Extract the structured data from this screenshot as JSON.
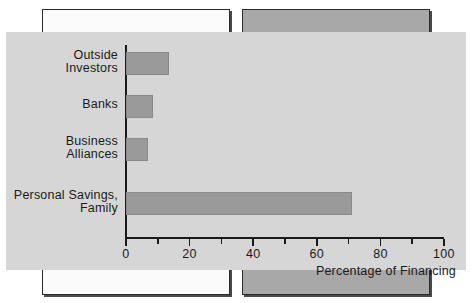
{
  "chart_data": {
    "type": "bar",
    "orientation": "horizontal",
    "title": "",
    "xlabel": "Percentage of Financing",
    "ylabel": "",
    "categories": [
      "Outside\nInvestors",
      "Banks",
      "Business\nAlliances",
      "Personal Savings,\nFamily"
    ],
    "values": [
      13.5,
      8.5,
      7,
      71
    ],
    "xlim": [
      0,
      100
    ],
    "xticks": [
      0,
      20,
      40,
      60,
      80,
      100
    ],
    "xtick_labels": [
      "0",
      "20",
      "40",
      "60",
      "80",
      "100"
    ],
    "minor_xticks": [
      10,
      30,
      50,
      70,
      90
    ],
    "grid": false,
    "legend": null,
    "bar_color": "#9a9a9a",
    "panel_color": "#d6d6d6",
    "axis_color": "#1a1a1a"
  },
  "decor": {
    "left_box_color": "#fbfbfb",
    "right_box_color": "#a8a8a8"
  }
}
